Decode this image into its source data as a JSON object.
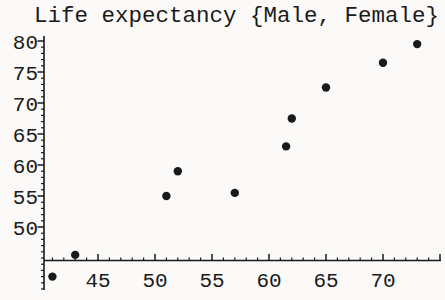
{
  "figure": {
    "background_color": "#fbfaf8",
    "ink_color": "#1a1a1a"
  },
  "chart": {
    "title": "Life expectancy {Male, Female}"
  },
  "chart_data": {
    "type": "scatter",
    "title": "Life expectancy {Male, Female}",
    "xlabel": "",
    "ylabel": "",
    "series_label": "{Male, Female}",
    "marker": "filled-circle",
    "marker_color": "#1a1a1a",
    "grid": false,
    "legend": "none",
    "x_tick_labels": [
      45,
      50,
      55,
      60,
      65,
      70
    ],
    "y_tick_labels": [
      50,
      55,
      60,
      65,
      70,
      75,
      80
    ],
    "minor_tick_step": 1,
    "xlim": [
      40,
      75
    ],
    "ylim": [
      40,
      81
    ],
    "axes_origin": [
      40,
      44.5
    ],
    "points": [
      {
        "x": 41,
        "y": 42
      },
      {
        "x": 43,
        "y": 45.5
      },
      {
        "x": 51,
        "y": 55
      },
      {
        "x": 52,
        "y": 59
      },
      {
        "x": 57,
        "y": 55.5
      },
      {
        "x": 61.5,
        "y": 63
      },
      {
        "x": 62,
        "y": 67.5
      },
      {
        "x": 65,
        "y": 72.5
      },
      {
        "x": 70,
        "y": 76.5
      },
      {
        "x": 73,
        "y": 79.5
      }
    ]
  }
}
